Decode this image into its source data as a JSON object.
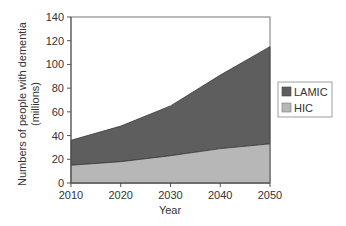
{
  "chart_data": {
    "type": "area",
    "stacked": true,
    "title": "",
    "xlabel": "Year",
    "ylabel": "Numbers of people with dementia (millions)",
    "ylabel_lines": [
      "Numbers of people with dementia",
      "(millions)"
    ],
    "x": [
      2010,
      2020,
      2030,
      2040,
      2050
    ],
    "xticks": [
      "2010",
      "2020",
      "2030",
      "2040",
      "2050"
    ],
    "yticks": [
      "0",
      "20",
      "40",
      "60",
      "80",
      "100",
      "120",
      "140"
    ],
    "ylim": [
      0,
      140
    ],
    "grid": false,
    "legend_position": "right",
    "series": [
      {
        "name": "HIC",
        "values": [
          15,
          18,
          23,
          29,
          33
        ],
        "color": "#b7b7b7"
      },
      {
        "name": "LAMIC",
        "values": [
          21,
          30,
          42,
          62,
          82
        ],
        "color": "#5e5e5e"
      }
    ],
    "totals": [
      36,
      48,
      65,
      91,
      115
    ]
  },
  "legend": {
    "items": [
      {
        "label": "LAMIC",
        "color": "#5e5e5e"
      },
      {
        "label": "HIC",
        "color": "#b7b7b7"
      }
    ]
  },
  "colors": {
    "axis": "#555555",
    "frame": "#777777",
    "text": "#333333"
  }
}
